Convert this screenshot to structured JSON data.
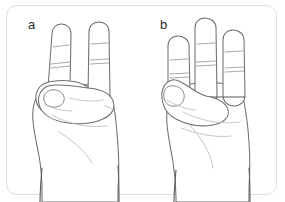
{
  "figure": {
    "kind": "line-drawing illustration",
    "background_color": "#ffffff",
    "frame": {
      "shape": "rounded-rectangle",
      "border_color": "#dcdcdc",
      "corner_radius_px": 11
    },
    "line_color": "#6e6e73",
    "crease_color": "#9a9aa0"
  },
  "panels": [
    {
      "label": "a",
      "description": "Hand with index and middle fingers extended in a V, ring finger curled and held by the thumb, little finger folded into the palm",
      "extended_fingers": 2,
      "thumb_state": "opposed, pad touching curled ring finger"
    },
    {
      "label": "b",
      "description": "Hand with index, middle and ring fingers extended upright and parallel, little finger folded, thumb bent down against the palm",
      "extended_fingers": 3,
      "thumb_state": "flexed against palm"
    }
  ]
}
